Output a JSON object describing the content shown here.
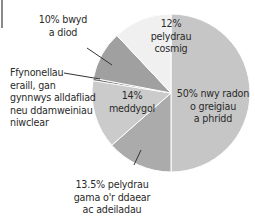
{
  "chart_data": {
    "type": "pie",
    "title": "",
    "start_angle_deg": 0,
    "direction": "clockwise",
    "slices": [
      {
        "label": "nwy radon o greigiau a phridd",
        "value": 50,
        "color": "#c6c6c6"
      },
      {
        "label": "pelydrau gama o'r ddaear ac adeiladau",
        "value": 13.5,
        "color": "#ababab"
      },
      {
        "label": "meddygol",
        "value": 14,
        "color": "#cbcbcb"
      },
      {
        "label": "Ffynonellau eraill, gan gynnwys alldafliad neu ddamweiniau niwclear",
        "value": 0.5,
        "color": "#6e6e6e"
      },
      {
        "label": "bwyd a diod",
        "value": 10,
        "color": "#a0a0a0"
      },
      {
        "label": "pelydrau cosmig",
        "value": 12,
        "color": "#f0f0f0"
      }
    ],
    "categories": [
      "nwy radon o greigiau a phridd",
      "pelydrau gama o'r ddaear ac adeiladau",
      "meddygol",
      "Ffynonellau eraill",
      "bwyd a diod",
      "pelydrau cosmig"
    ],
    "values": [
      50,
      13.5,
      14,
      0.5,
      10,
      12
    ],
    "legend": "none (inline labels)"
  },
  "labels": {
    "radon": [
      "50% nwy radon",
      "o greigiau",
      "a phridd"
    ],
    "gamma": [
      "13.5% pelydrau",
      "gama o'r ddaear",
      "ac adeiladau"
    ],
    "medical": [
      "14%",
      "meddygol"
    ],
    "other": [
      "Ffynonellau",
      "eraill, gan",
      "gynnwys alldafliad",
      "neu ddamweiniau",
      "niwclear"
    ],
    "food": [
      "10% bwyd",
      "a diod"
    ],
    "cosmic": [
      "12%",
      "pelydrau",
      "cosmig"
    ]
  }
}
